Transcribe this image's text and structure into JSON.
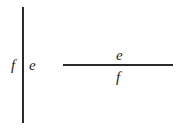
{
  "diagram": {
    "vertical_divider": {
      "orientation": "vertical",
      "left_label": "f",
      "right_label": "e"
    },
    "horizontal_divider": {
      "orientation": "horizontal",
      "top_label": "e",
      "bottom_label": "f"
    },
    "colors": {
      "line": "#2a2a2a",
      "text": "#222222",
      "background": "#ffffff"
    }
  }
}
